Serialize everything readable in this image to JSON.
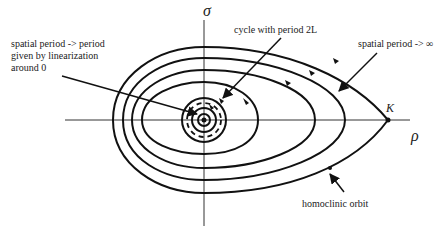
{
  "diagram": {
    "axes": {
      "x_label": "ρ",
      "y_label": "σ"
    },
    "point_label": "K",
    "annotations": {
      "linearization": [
        "spatial period -> period",
        "given by linearization",
        "around 0"
      ],
      "cycle": "cycle with period 2L",
      "infinite_period": "spatial period -> ∞",
      "homoclinic": "homoclinic orbit"
    }
  }
}
